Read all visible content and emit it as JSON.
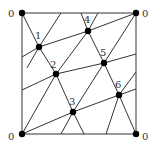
{
  "diagram": {
    "corners": [
      {
        "label": "0",
        "x": 22,
        "y": 13,
        "lx": 8,
        "ly": 9
      },
      {
        "label": "0",
        "x": 136,
        "y": 13,
        "lx": 142,
        "ly": 9
      },
      {
        "label": "0",
        "x": 22,
        "y": 134,
        "lx": 8,
        "ly": 132
      },
      {
        "label": "0",
        "x": 136,
        "y": 134,
        "lx": 142,
        "ly": 132
      }
    ],
    "points": [
      {
        "label": "1",
        "x": 39,
        "y": 47,
        "lx": 35,
        "ly": 31
      },
      {
        "label": "2",
        "x": 56,
        "y": 74,
        "lx": 50,
        "ly": 60
      },
      {
        "label": "3",
        "x": 73,
        "y": 112,
        "lx": 69,
        "ly": 97
      },
      {
        "label": "4",
        "x": 88,
        "y": 31,
        "lx": 84,
        "ly": 15
      },
      {
        "label": "5",
        "x": 104,
        "y": 63,
        "lx": 100,
        "ly": 48
      },
      {
        "label": "6",
        "x": 119,
        "y": 95,
        "lx": 115,
        "ly": 80
      }
    ],
    "lines": [
      [
        22,
        13,
        136,
        13
      ],
      [
        22,
        134,
        136,
        134
      ],
      [
        22,
        13,
        22,
        134
      ],
      [
        136,
        13,
        136,
        134
      ],
      [
        22,
        57,
        39,
        47
      ],
      [
        39,
        47,
        88,
        31
      ],
      [
        88,
        31,
        136,
        13
      ],
      [
        22,
        90,
        56,
        74
      ],
      [
        56,
        74,
        104,
        63
      ],
      [
        104,
        63,
        136,
        54
      ],
      [
        22,
        134,
        73,
        112
      ],
      [
        73,
        112,
        119,
        95
      ],
      [
        119,
        95,
        136,
        89
      ],
      [
        22,
        13,
        39,
        47
      ],
      [
        39,
        47,
        56,
        74
      ],
      [
        56,
        74,
        73,
        112
      ],
      [
        73,
        112,
        84,
        134
      ],
      [
        81,
        13,
        88,
        31
      ],
      [
        88,
        31,
        104,
        63
      ],
      [
        104,
        63,
        119,
        95
      ],
      [
        119,
        95,
        136,
        134
      ],
      [
        27,
        68,
        39,
        47
      ],
      [
        39,
        47,
        61,
        13
      ],
      [
        22,
        134,
        56,
        74
      ],
      [
        56,
        74,
        88,
        31
      ],
      [
        88,
        31,
        98,
        13
      ],
      [
        73,
        112,
        104,
        63
      ],
      [
        104,
        63,
        136,
        13
      ],
      [
        61,
        134,
        73,
        112
      ],
      [
        106,
        134,
        119,
        95
      ],
      [
        119,
        95,
        136,
        72
      ]
    ],
    "line_color": "#333333",
    "point_color": "#000000"
  }
}
